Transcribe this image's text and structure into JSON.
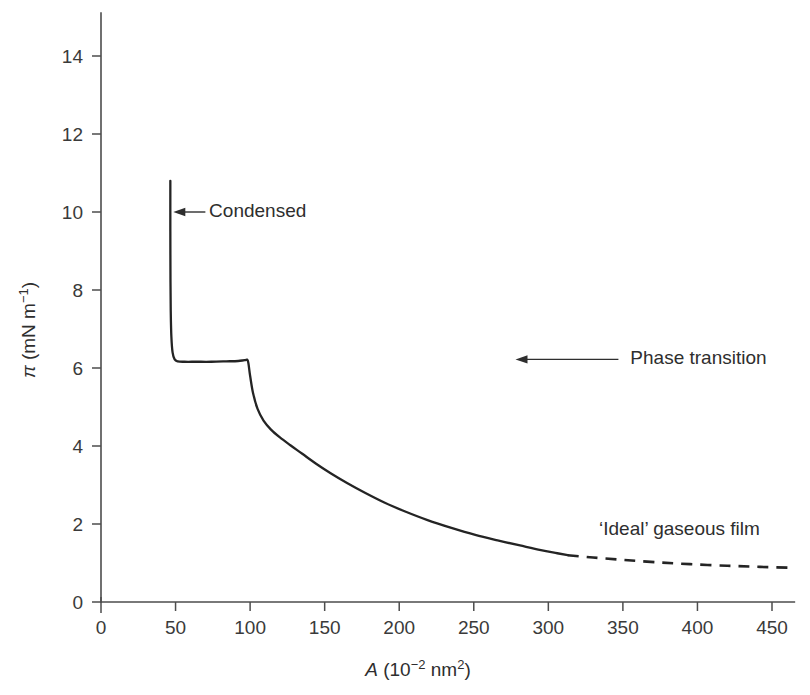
{
  "chart_data": {
    "type": "line",
    "title": "",
    "xlabel": "A (10−2 nm²)",
    "ylabel": "π (mN m⁻¹)",
    "xlim": [
      0,
      465
    ],
    "ylim": [
      0,
      15.1
    ],
    "grid": false,
    "legend": "none",
    "xticks": [
      0,
      50,
      100,
      150,
      200,
      250,
      300,
      350,
      400,
      450
    ],
    "xtick_labels": [
      "0",
      "50",
      "100",
      "150",
      "200",
      "250",
      "300",
      "350",
      "400",
      "450"
    ],
    "yticks": [
      0,
      2,
      4,
      6,
      8,
      10,
      12,
      14
    ],
    "ytick_labels": [
      "0",
      "2",
      "4",
      "6",
      "8",
      "10",
      "12",
      "14"
    ],
    "series": [
      {
        "name": "isotherm-solid",
        "style": "solid",
        "points": [
          [
            46.5,
            10.8
          ],
          [
            46.5,
            9.5
          ],
          [
            46.6,
            8.2
          ],
          [
            46.8,
            7.4
          ],
          [
            47.2,
            6.8
          ],
          [
            48.0,
            6.4
          ],
          [
            49.4,
            6.22
          ],
          [
            51.5,
            6.17
          ],
          [
            56.0,
            6.16
          ],
          [
            64.0,
            6.16
          ],
          [
            74.0,
            6.16
          ],
          [
            84.0,
            6.17
          ],
          [
            92.0,
            6.18
          ],
          [
            96.5,
            6.2
          ],
          [
            98.5,
            6.18
          ],
          [
            100.0,
            5.8
          ],
          [
            102.0,
            5.35
          ],
          [
            105.0,
            4.95
          ],
          [
            109.0,
            4.65
          ],
          [
            114.0,
            4.42
          ],
          [
            120.0,
            4.22
          ],
          [
            127.0,
            4.02
          ],
          [
            135.0,
            3.8
          ],
          [
            144.0,
            3.55
          ],
          [
            154.0,
            3.3
          ],
          [
            165.0,
            3.05
          ],
          [
            177.0,
            2.8
          ],
          [
            190.0,
            2.55
          ],
          [
            204.0,
            2.32
          ],
          [
            219.0,
            2.1
          ],
          [
            235.0,
            1.9
          ],
          [
            251.0,
            1.72
          ],
          [
            266.0,
            1.58
          ],
          [
            281.0,
            1.45
          ],
          [
            295.0,
            1.33
          ],
          [
            306.0,
            1.25
          ],
          [
            313.0,
            1.2
          ]
        ]
      },
      {
        "name": "ideal-gaseous-extrapolation",
        "style": "dashed",
        "points": [
          [
            313.0,
            1.2
          ],
          [
            330.0,
            1.14
          ],
          [
            350.0,
            1.08
          ],
          [
            372.0,
            1.02
          ],
          [
            395.0,
            0.97
          ],
          [
            420.0,
            0.93
          ],
          [
            442.0,
            0.9
          ],
          [
            463.0,
            0.88
          ]
        ]
      }
    ],
    "annotations": [
      {
        "id": "condensed",
        "label": "Condensed",
        "arrow": {
          "from_x": 70.0,
          "from_y": 10.0,
          "to_x": 48.5,
          "to_y": 10.0
        },
        "text_x": 72.5,
        "text_y": 10.0
      },
      {
        "id": "phase-transition",
        "label": "Phase transition",
        "arrow": {
          "from_x": 347.0,
          "from_y": 6.22,
          "to_x": 278.0,
          "to_y": 6.22
        },
        "text_x": 355.0,
        "text_y": 6.22
      },
      {
        "id": "ideal-gaseous-film",
        "label": "‘Ideal’ gaseous film",
        "arrow": null,
        "text_x": 334.0,
        "text_y": 1.85
      }
    ],
    "colors": {
      "curve": "#242424",
      "axis": "#4d4d4d",
      "text": "#2e2e2e",
      "background": "#ffffff"
    }
  }
}
